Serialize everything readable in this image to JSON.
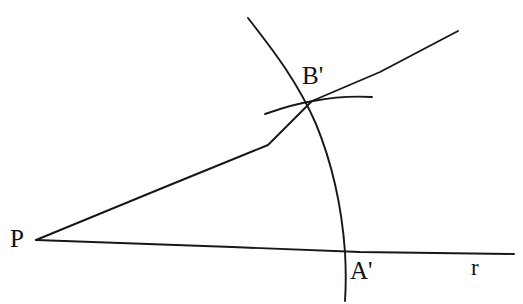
{
  "figure": {
    "background_color": "#ffffff",
    "stroke_color": "#15171a",
    "width": 523,
    "height": 304,
    "labels": {
      "vertex": "P",
      "arc_ray_intersection": "B'",
      "arc_base_intersection": "A'",
      "base_ray": "r"
    },
    "points": {
      "P": {
        "x": 36,
        "y": 240
      },
      "A'": {
        "x": 346,
        "y": 252
      },
      "B'": {
        "x": 312,
        "y": 101
      }
    },
    "elements": {
      "base_ray_name": "ray-r",
      "upper_ray_name": "ray-upper",
      "big_arc_name": "arc-major",
      "small_arc_name": "arc-minor"
    },
    "paths": {
      "base_ray": "M 36 240 L 232 247 L 360 252 L 514 254",
      "upper_ray": "M 36 240 L 160 189 L 268 145 L 312 101 L 380 72 L 458 31",
      "big_arc": "M 248 18 C 268 44 296 78 316 124 C 332 163 342 210 345 252 C 346 270 346 286 345 301",
      "small_arc": "M 265 114 C 285 107 300 103 313 101 C 334 97 356 96 372 97"
    }
  }
}
